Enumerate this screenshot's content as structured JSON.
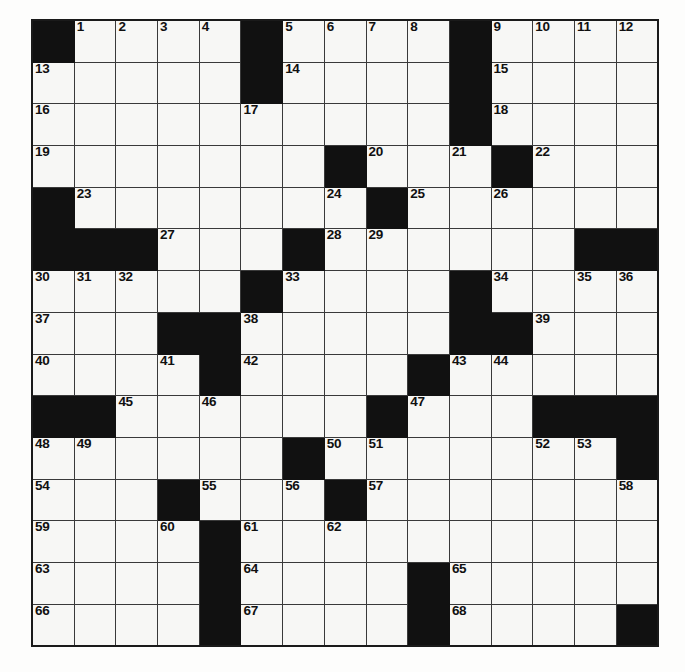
{
  "puzzle": {
    "title": "Crossword Puzzle Grid",
    "type": "crossword",
    "rows": 15,
    "cols": 15,
    "cell_size": 41.7,
    "colors": {
      "block": "#111111",
      "cell": "#f7f7f5",
      "grid_line": "#3a3a3a",
      "border": "#1a1a1a",
      "number": "#101010"
    },
    "blocks": [
      [
        0,
        0
      ],
      [
        0,
        5
      ],
      [
        0,
        10
      ],
      [
        1,
        5
      ],
      [
        1,
        10
      ],
      [
        2,
        10
      ],
      [
        3,
        7
      ],
      [
        3,
        11
      ],
      [
        4,
        0
      ],
      [
        4,
        8
      ],
      [
        5,
        0
      ],
      [
        5,
        1
      ],
      [
        5,
        2
      ],
      [
        5,
        6
      ],
      [
        5,
        13
      ],
      [
        5,
        14
      ],
      [
        6,
        5
      ],
      [
        6,
        10
      ],
      [
        7,
        3
      ],
      [
        7,
        4
      ],
      [
        7,
        10
      ],
      [
        7,
        11
      ],
      [
        8,
        4
      ],
      [
        8,
        9
      ],
      [
        9,
        0
      ],
      [
        9,
        1
      ],
      [
        9,
        8
      ],
      [
        9,
        12
      ],
      [
        9,
        13
      ],
      [
        9,
        14
      ],
      [
        10,
        6
      ],
      [
        10,
        14
      ],
      [
        11,
        3
      ],
      [
        11,
        7
      ],
      [
        12,
        4
      ],
      [
        12,
        4
      ],
      [
        13,
        4
      ],
      [
        13,
        9
      ],
      [
        14,
        4
      ],
      [
        14,
        9
      ],
      [
        14,
        14
      ]
    ],
    "numbers": [
      {
        "r": 0,
        "c": 1,
        "n": "1"
      },
      {
        "r": 0,
        "c": 2,
        "n": "2"
      },
      {
        "r": 0,
        "c": 3,
        "n": "3"
      },
      {
        "r": 0,
        "c": 4,
        "n": "4"
      },
      {
        "r": 0,
        "c": 6,
        "n": "5"
      },
      {
        "r": 0,
        "c": 7,
        "n": "6"
      },
      {
        "r": 0,
        "c": 8,
        "n": "7"
      },
      {
        "r": 0,
        "c": 9,
        "n": "8"
      },
      {
        "r": 0,
        "c": 11,
        "n": "9"
      },
      {
        "r": 0,
        "c": 12,
        "n": "10"
      },
      {
        "r": 0,
        "c": 13,
        "n": "11"
      },
      {
        "r": 0,
        "c": 14,
        "n": "12"
      },
      {
        "r": 1,
        "c": 0,
        "n": "13"
      },
      {
        "r": 1,
        "c": 6,
        "n": "14"
      },
      {
        "r": 1,
        "c": 11,
        "n": "15"
      },
      {
        "r": 2,
        "c": 0,
        "n": "16"
      },
      {
        "r": 2,
        "c": 5,
        "n": "17"
      },
      {
        "r": 2,
        "c": 11,
        "n": "18"
      },
      {
        "r": 3,
        "c": 0,
        "n": "19"
      },
      {
        "r": 3,
        "c": 8,
        "n": "20"
      },
      {
        "r": 3,
        "c": 10,
        "n": "21"
      },
      {
        "r": 3,
        "c": 12,
        "n": "22"
      },
      {
        "r": 4,
        "c": 1,
        "n": "23"
      },
      {
        "r": 4,
        "c": 7,
        "n": "24"
      },
      {
        "r": 4,
        "c": 9,
        "n": "25"
      },
      {
        "r": 4,
        "c": 11,
        "n": "26"
      },
      {
        "r": 5,
        "c": 3,
        "n": "27"
      },
      {
        "r": 5,
        "c": 7,
        "n": "28"
      },
      {
        "r": 5,
        "c": 8,
        "n": "29"
      },
      {
        "r": 6,
        "c": 0,
        "n": "30"
      },
      {
        "r": 6,
        "c": 1,
        "n": "31"
      },
      {
        "r": 6,
        "c": 2,
        "n": "32"
      },
      {
        "r": 6,
        "c": 6,
        "n": "33"
      },
      {
        "r": 6,
        "c": 11,
        "n": "34"
      },
      {
        "r": 6,
        "c": 13,
        "n": "35"
      },
      {
        "r": 6,
        "c": 14,
        "n": "36"
      },
      {
        "r": 7,
        "c": 0,
        "n": "37"
      },
      {
        "r": 7,
        "c": 5,
        "n": "38"
      },
      {
        "r": 7,
        "c": 12,
        "n": "39"
      },
      {
        "r": 8,
        "c": 0,
        "n": "40"
      },
      {
        "r": 8,
        "c": 3,
        "n": "41"
      },
      {
        "r": 8,
        "c": 5,
        "n": "42"
      },
      {
        "r": 8,
        "c": 10,
        "n": "43"
      },
      {
        "r": 8,
        "c": 11,
        "n": "44"
      },
      {
        "r": 9,
        "c": 2,
        "n": "45"
      },
      {
        "r": 9,
        "c": 4,
        "n": "46"
      },
      {
        "r": 9,
        "c": 9,
        "n": "47"
      },
      {
        "r": 10,
        "c": 0,
        "n": "48"
      },
      {
        "r": 10,
        "c": 1,
        "n": "49"
      },
      {
        "r": 10,
        "c": 7,
        "n": "50"
      },
      {
        "r": 10,
        "c": 8,
        "n": "51"
      },
      {
        "r": 10,
        "c": 12,
        "n": "52"
      },
      {
        "r": 10,
        "c": 13,
        "n": "53"
      },
      {
        "r": 11,
        "c": 0,
        "n": "54"
      },
      {
        "r": 11,
        "c": 4,
        "n": "55"
      },
      {
        "r": 11,
        "c": 6,
        "n": "56"
      },
      {
        "r": 11,
        "c": 8,
        "n": "57"
      },
      {
        "r": 11,
        "c": 14,
        "n": "58"
      },
      {
        "r": 12,
        "c": 0,
        "n": "59"
      },
      {
        "r": 12,
        "c": 3,
        "n": "60"
      },
      {
        "r": 12,
        "c": 5,
        "n": "61"
      },
      {
        "r": 12,
        "c": 7,
        "n": "62"
      },
      {
        "r": 13,
        "c": 0,
        "n": "63"
      },
      {
        "r": 13,
        "c": 5,
        "n": "64"
      },
      {
        "r": 13,
        "c": 10,
        "n": "65"
      },
      {
        "r": 14,
        "c": 0,
        "n": "66"
      },
      {
        "r": 14,
        "c": 5,
        "n": "67"
      },
      {
        "r": 14,
        "c": 10,
        "n": "68"
      }
    ]
  }
}
